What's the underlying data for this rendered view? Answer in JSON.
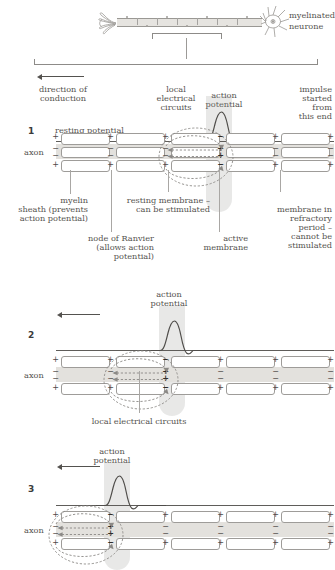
{
  "top": {
    "neuron_label_line1": "myelinated",
    "neuron_label_line2": "neurone"
  },
  "annotations": {
    "direction_of_conduction": "direction of\nconduction",
    "direction_line1": "direction of",
    "direction_line2": "conduction",
    "local_electrical_circuits_line1": "local",
    "local_electrical_circuits_line2": "electrical",
    "local_electrical_circuits_line3": "circuits",
    "action_potential_line1": "action",
    "action_potential_line2": "potential",
    "impulse_line1": "impulse",
    "impulse_line2": "started",
    "impulse_line3": "from",
    "impulse_line4": "this end",
    "resting_potential": "resting potential",
    "myelin_sheath_line1": "myelin",
    "myelin_sheath_line2": "sheath (prevents",
    "myelin_sheath_line3": "action potential)",
    "resting_membrane_line1": "resting membrane –",
    "resting_membrane_line2": "can be stimulated",
    "refractory_line1": "membrane in",
    "refractory_line2": "refractory",
    "refractory_line3": "period –",
    "refractory_line4": "cannot be",
    "refractory_line5": "stimulated",
    "node_of_ranvier_line1": "node of Ranvier",
    "node_of_ranvier_line2": "(allows action",
    "node_of_ranvier_line3": "potential)",
    "active_membrane_line1": "active",
    "active_membrane_line2": "membrane",
    "local_electrical_circuits_panel2": "local electrical circuits",
    "axon": "axon"
  },
  "panels": [
    {
      "number": "1",
      "trace_label": "resting potential",
      "active_node_index": 3,
      "membrane_charges_outside": [
        "+",
        "+",
        "+",
        "−",
        "+",
        "+"
      ],
      "membrane_charges_inside": [
        "−",
        "−",
        "−",
        "+",
        "−",
        "−"
      ]
    },
    {
      "number": "2",
      "trace_label": "action potential",
      "active_node_index": 2,
      "membrane_charges_outside": [
        "+",
        "+",
        "−",
        "+",
        "+",
        "+"
      ],
      "membrane_charges_inside": [
        "−",
        "−",
        "+",
        "−",
        "−",
        "−"
      ]
    },
    {
      "number": "3",
      "trace_label": "action potential",
      "active_node_index": 1,
      "membrane_charges_outside": [
        "+",
        "−",
        "+",
        "+",
        "+",
        "+"
      ],
      "membrane_charges_inside": [
        "−",
        "+",
        "−",
        "−",
        "−",
        "−"
      ]
    }
  ],
  "colors": {
    "ink": "#4f4d4a",
    "label_text": "#55534f",
    "membrane_stroke": "#9e9c99",
    "axon_fill": "#e3e1dd",
    "highlight": "rgba(150,148,145,0.22)"
  }
}
